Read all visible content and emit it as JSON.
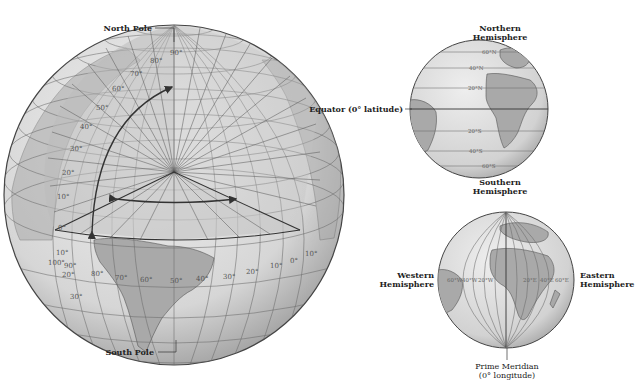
{
  "main_globe": {
    "north_pole_label": "North Pole",
    "south_pole_label": "South Pole",
    "latitude_labels": [
      "90°",
      "80°",
      "70°",
      "60°",
      "50°",
      "40°",
      "30°",
      "20°",
      "10°",
      "0°"
    ],
    "southern_latitude_labels": [
      "10°",
      "20°",
      "30°"
    ],
    "longitude_labels": [
      "100°",
      "90°",
      "80°",
      "70°",
      "60°",
      "50°",
      "40°",
      "30°",
      "20°",
      "10°",
      "0°",
      "10°"
    ]
  },
  "ns_globe": {
    "top_label_line1": "Northern",
    "top_label_line2": "Hemisphere",
    "bottom_label_line1": "Southern",
    "bottom_label_line2": "Hemisphere",
    "equator_label": "Equator (0° latitude)",
    "latitude_labels": [
      "60°N",
      "40°N",
      "20°N",
      "20°S",
      "40°S",
      "60°S"
    ]
  },
  "ew_globe": {
    "left_label_line1": "Western",
    "left_label_line2": "Hemisphere",
    "right_label_line1": "Eastern",
    "right_label_line2": "Hemisphere",
    "meridian_label_line1": "Prime Meridian",
    "meridian_label_line2": "(0° longitude)",
    "longitude_labels": [
      "60°W",
      "40°W",
      "20°W",
      "20°E",
      "40°E",
      "60°E"
    ]
  },
  "colors": {
    "globe_fill": "#d9d9d9",
    "land": "#a9a9a9",
    "grid": "#6a6a6a",
    "arrow": "#333333"
  }
}
